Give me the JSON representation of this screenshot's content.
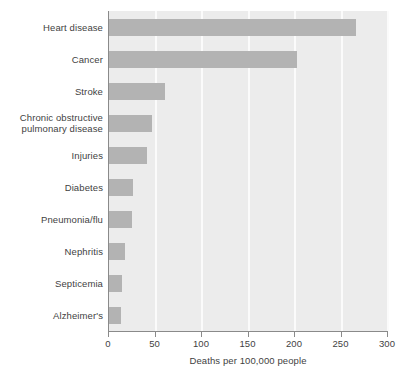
{
  "chart_data": {
    "type": "bar",
    "orientation": "horizontal",
    "title": "",
    "xlabel": "Deaths per 100,000 people",
    "ylabel": "",
    "categories": [
      "Heart disease",
      "Cancer",
      "Stroke",
      "Chronic obstructive pulmonary disease",
      "Injuries",
      "Diabetes",
      "Pneumonia/flu",
      "Nephritis",
      "Septicemia",
      "Alzheimer's"
    ],
    "values": [
      266,
      202,
      60,
      46,
      41,
      26,
      25,
      17,
      14,
      13
    ],
    "xlim": [
      0,
      300
    ],
    "xticks": [
      0,
      50,
      100,
      150,
      200,
      250,
      300
    ],
    "xtick_labels": [
      "0",
      "50",
      "100",
      "150",
      "200",
      "250",
      "300"
    ],
    "grid": "vertical",
    "legend": "none",
    "bar_color": "#b3b3b3",
    "plot_background": "#ececec",
    "gridline_color": "#fbfbfb",
    "axis_color": "#8a8a8a"
  },
  "category_label_lines": [
    [
      "Heart disease"
    ],
    [
      "Cancer"
    ],
    [
      "Stroke"
    ],
    [
      "Chronic obstructive",
      "pulmonary disease"
    ],
    [
      "Injuries"
    ],
    [
      "Diabetes"
    ],
    [
      "Pneumonia/flu"
    ],
    [
      "Nephritis"
    ],
    [
      "Septicemia"
    ],
    [
      "Alzheimer's"
    ]
  ]
}
